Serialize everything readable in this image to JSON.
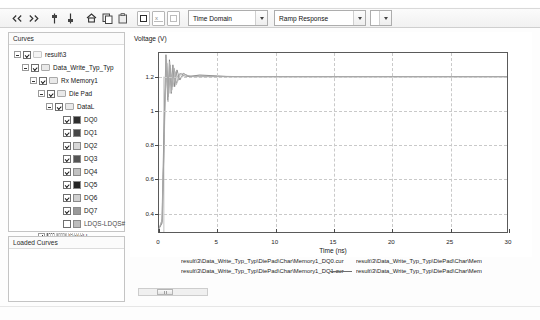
{
  "toolbar": {
    "icons": [
      {
        "name": "prev-marker-icon",
        "glyph": "markers-left"
      },
      {
        "name": "next-marker-icon",
        "glyph": "markers-right"
      },
      {
        "name": "vertical-marker-icon",
        "glyph": "marker-v"
      },
      {
        "name": "vertical-marker-alt-icon",
        "glyph": "marker-v2"
      },
      {
        "name": "home-icon",
        "glyph": "home"
      },
      {
        "name": "copy-icon",
        "glyph": "copy"
      },
      {
        "name": "paste-icon",
        "glyph": "paste"
      }
    ],
    "boxes": [
      {
        "name": "zoom-box-icon"
      },
      {
        "name": "zoom-x-icon",
        "label": "x"
      },
      {
        "name": "zoom-y-icon"
      }
    ],
    "domain_select": {
      "value": "Time Domain",
      "name": "domain-select"
    },
    "response_select": {
      "value": "Ramp Response",
      "name": "response-select"
    },
    "extra_select": {
      "value": "",
      "name": "extra-select"
    }
  },
  "curves_panel": {
    "title": "Curves",
    "tree": [
      {
        "indent": 0,
        "expander": "minus",
        "checked": true,
        "folder": false,
        "swatch": null,
        "label": "result\\3"
      },
      {
        "indent": 1,
        "expander": "minus",
        "checked": true,
        "folder": true,
        "swatch": null,
        "label": "Data_Write_Typ_Typ"
      },
      {
        "indent": 2,
        "expander": "minus",
        "checked": true,
        "folder": true,
        "swatch": null,
        "label": "Rx Memory1"
      },
      {
        "indent": 3,
        "expander": "minus",
        "checked": true,
        "folder": true,
        "swatch": null,
        "label": "Die Pad"
      },
      {
        "indent": 4,
        "expander": "minus",
        "checked": true,
        "folder": true,
        "swatch": null,
        "label": "DataL"
      },
      {
        "indent": 5,
        "expander": "none",
        "checked": true,
        "folder": false,
        "swatch": "#2f2f2f",
        "label": "DQ0"
      },
      {
        "indent": 5,
        "expander": "none",
        "checked": true,
        "folder": false,
        "swatch": "#474747",
        "label": "DQ1"
      },
      {
        "indent": 5,
        "expander": "none",
        "checked": true,
        "folder": false,
        "swatch": "#d8d8d8",
        "label": "DQ2"
      },
      {
        "indent": 5,
        "expander": "none",
        "checked": true,
        "folder": false,
        "swatch": "#555555",
        "label": "DQ3"
      },
      {
        "indent": 5,
        "expander": "none",
        "checked": true,
        "folder": false,
        "swatch": "#c2c2c2",
        "label": "DQ4"
      },
      {
        "indent": 5,
        "expander": "none",
        "checked": true,
        "folder": false,
        "swatch": "#242424",
        "label": "DQ5"
      },
      {
        "indent": 5,
        "expander": "none",
        "checked": true,
        "folder": false,
        "swatch": "#d0d0d0",
        "label": "DQ6"
      },
      {
        "indent": 5,
        "expander": "none",
        "checked": true,
        "folder": false,
        "swatch": "#9a9a9a",
        "label": "DQ7"
      },
      {
        "indent": 5,
        "expander": "none",
        "checked": false,
        "folder": false,
        "swatch": "#bdbdbd",
        "label": "LDQS-LDQS#"
      },
      {
        "indent": 3,
        "expander": "plus",
        "checked": false,
        "folder": true,
        "swatch": null,
        "label": "DataU"
      }
    ]
  },
  "loaded_panel": {
    "title": "Loaded Curves"
  },
  "chart_data": {
    "type": "line",
    "title": "",
    "ylabel": "Voltage (V)",
    "xlabel": "Time (ns)",
    "xticks": [
      0,
      5,
      10,
      15,
      20,
      25,
      30
    ],
    "yticks": [
      0.4,
      0.6,
      0.8,
      1,
      1.2
    ],
    "xlim": [
      0,
      30
    ],
    "ylim": [
      0.28,
      1.34
    ],
    "grid": true,
    "legend_position": "bottom",
    "series": [
      {
        "name": "result\\3\\Data_Write_Typ_Typ\\DiePad\\Char\\Memory1_DQ0.cur",
        "color": "#6d6d6d",
        "points": [
          [
            0,
            0.3
          ],
          [
            0.25,
            0.33
          ],
          [
            0.45,
            0.95
          ],
          [
            0.6,
            1.33
          ],
          [
            0.75,
            1.06
          ],
          [
            0.9,
            1.3
          ],
          [
            1.05,
            1.1
          ],
          [
            1.2,
            1.27
          ],
          [
            1.35,
            1.14
          ],
          [
            1.55,
            1.24
          ],
          [
            1.8,
            1.18
          ],
          [
            2.1,
            1.22
          ],
          [
            2.6,
            1.2
          ],
          [
            3.5,
            1.21
          ],
          [
            6,
            1.2
          ],
          [
            12,
            1.2
          ],
          [
            20,
            1.2
          ],
          [
            30,
            1.2
          ]
        ]
      },
      {
        "name": "result\\3\\Data_Write_Typ_Typ\\DiePad\\Char\\Memory1_DQ1.cur",
        "color": "#8a8a8a",
        "points": [
          [
            0,
            0.3
          ],
          [
            0.28,
            0.34
          ],
          [
            0.5,
            1.0
          ],
          [
            0.65,
            1.3
          ],
          [
            0.8,
            1.08
          ],
          [
            0.95,
            1.27
          ],
          [
            1.1,
            1.12
          ],
          [
            1.3,
            1.25
          ],
          [
            1.5,
            1.16
          ],
          [
            1.8,
            1.22
          ],
          [
            2.3,
            1.2
          ],
          [
            3.2,
            1.205
          ],
          [
            7,
            1.2
          ],
          [
            15,
            1.2
          ],
          [
            30,
            1.2
          ]
        ]
      },
      {
        "name": "result\\3\\Data_Write_Typ_Typ\\DiePad\\Char\\Mem",
        "color": "#9c9c9c",
        "points": [
          [
            0,
            0.3
          ],
          [
            0.3,
            0.36
          ],
          [
            0.5,
            1.05
          ],
          [
            0.68,
            1.28
          ],
          [
            0.85,
            1.1
          ],
          [
            1.0,
            1.25
          ],
          [
            1.2,
            1.14
          ],
          [
            1.45,
            1.23
          ],
          [
            1.7,
            1.18
          ],
          [
            2.2,
            1.21
          ],
          [
            3,
            1.2
          ],
          [
            9,
            1.2
          ],
          [
            30,
            1.2
          ]
        ]
      },
      {
        "name": "result\\3\\Data_Write_Typ_Typ\\DiePad\\Char\\Mem",
        "color": "#b2b2b2",
        "points": [
          [
            0,
            0.3
          ],
          [
            0.26,
            0.35
          ],
          [
            0.48,
            0.9
          ],
          [
            0.62,
            1.31
          ],
          [
            0.78,
            1.05
          ],
          [
            0.92,
            1.29
          ],
          [
            1.08,
            1.11
          ],
          [
            1.25,
            1.26
          ],
          [
            1.48,
            1.15
          ],
          [
            1.9,
            1.22
          ],
          [
            2.8,
            1.2
          ],
          [
            11,
            1.2
          ],
          [
            30,
            1.2
          ]
        ]
      }
    ],
    "vertical_dropline_x": 0.42
  },
  "legend": {
    "entries": [
      {
        "col": 0,
        "row": 0,
        "line": false,
        "text": "result\\3\\Data_Write_Typ_Typ\\DiePad\\Char\\Memory1_DQ0.cur"
      },
      {
        "col": 0,
        "row": 1,
        "line": false,
        "text": "result\\3\\Data_Write_Typ_Typ\\DiePad\\Char\\Memory1_DQ1.cur"
      },
      {
        "col": 1,
        "row": 0,
        "line": false,
        "text": "result\\3\\Data_Write_Typ_Typ\\DiePad\\Char\\Mem"
      },
      {
        "col": 1,
        "row": 1,
        "line": true,
        "text": "result\\3\\Data_Write_Typ_Typ\\DiePad\\Char\\Mem"
      }
    ]
  }
}
